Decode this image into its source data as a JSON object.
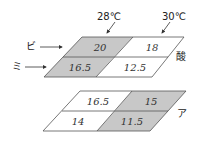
{
  "colors": {
    "shaded": "#c8c8c8",
    "unshaded": "#ffffff",
    "line": "#555555",
    "text": "#222222"
  },
  "temperature_labels": [
    "28℃",
    "30℃"
  ],
  "row_labels": [
    "ビ",
    "ミ"
  ],
  "panels": [
    {
      "label": "酸",
      "cells": [
        {
          "row": "ビ",
          "temp": "28℃",
          "value": "20",
          "shaded": true
        },
        {
          "row": "ビ",
          "temp": "30℃",
          "value": "18",
          "shaded": false
        },
        {
          "row": "ミ",
          "temp": "28℃",
          "value": "16.5",
          "shaded": true
        },
        {
          "row": "ミ",
          "temp": "30℃",
          "value": "12.5",
          "shaded": false
        }
      ]
    },
    {
      "label": "ア",
      "cells": [
        {
          "row": "ビ",
          "temp": "28℃",
          "value": "16.5",
          "shaded": false
        },
        {
          "row": "ビ",
          "temp": "30℃",
          "value": "15",
          "shaded": true
        },
        {
          "row": "ミ",
          "temp": "28℃",
          "value": "14",
          "shaded": false
        },
        {
          "row": "ミ",
          "temp": "30℃",
          "value": "11.5",
          "shaded": true
        }
      ]
    }
  ]
}
